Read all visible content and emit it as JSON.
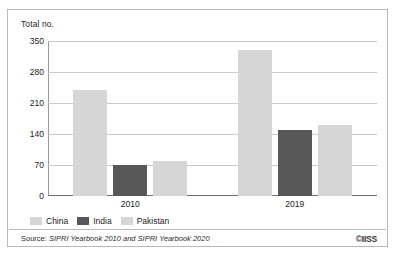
{
  "figure": {
    "clipped_caption": "",
    "y_axis_title": "Total no.",
    "source_lead": "Source: ",
    "source_ref": "SIPRI Yearbook 2010 and SIPRI Yearbook 2020",
    "logo": "©IISS"
  },
  "legend": {
    "position": "bottom-left",
    "items": [
      {
        "label": "China",
        "color": "#d6d6d6"
      },
      {
        "label": "India",
        "color": "#575757"
      },
      {
        "label": "Pakistan",
        "color": "#d6d6d6"
      }
    ]
  },
  "chart_data": {
    "type": "bar",
    "title": "",
    "subtitle": "",
    "xlabel": "",
    "ylabel": "Total no.",
    "categories": [
      "2010",
      "2019"
    ],
    "yticks": [
      0,
      70,
      140,
      210,
      280,
      350
    ],
    "ylim": [
      0,
      350
    ],
    "grid": true,
    "legend_position": "bottom-left",
    "series": [
      {
        "name": "China",
        "color": "#d6d6d6",
        "values": [
          240,
          330
        ]
      },
      {
        "name": "India",
        "color": "#575757",
        "values": [
          70,
          150
        ]
      },
      {
        "name": "Pakistan",
        "color": "#d6d6d6",
        "values": [
          80,
          160
        ]
      }
    ],
    "annotations": [],
    "source": "Source: SIPRI Yearbook 2010 and SIPRI Yearbook 2020"
  }
}
